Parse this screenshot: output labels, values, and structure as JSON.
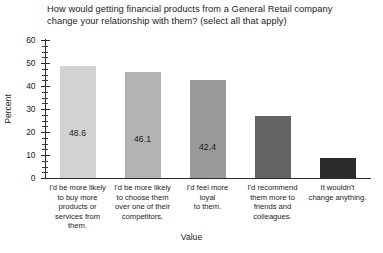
{
  "chart_data": {
    "type": "bar",
    "title": "How would getting financial products from a General Retail company\nchange your relationship with them? (select all that apply)",
    "xlabel": "Value",
    "ylabel": "Percent",
    "ylim": [
      0,
      60
    ],
    "y_major_ticks": [
      0,
      10,
      20,
      30,
      40,
      50,
      60
    ],
    "y_minor_tick_step": 2.5,
    "grid": false,
    "legend": "none",
    "categories": [
      "I'd be more likely\nto buy more\nproducts or\nservices from\nthem.",
      "I'd be more likely\nto choose them\nover one of their\ncompetitors.",
      "I'd feel more\nloyal\nto them.",
      "I'd recommend\nthem more to\nfriends and\ncolleagues.",
      "It wouldn't\nchange anything."
    ],
    "values": [
      48.6,
      46.1,
      42.4,
      26.8,
      8.6
    ],
    "value_labels": [
      "48.6",
      "46.1",
      "42.4",
      "26.8",
      "8.6"
    ],
    "bar_colors": [
      "#d2d2d2",
      "#b3b3b3",
      "#9a9a9a",
      "#636363",
      "#2b2b2b"
    ],
    "value_label_colors": [
      "#1b1b1b",
      "#1b1b1b",
      "#1b1b1b",
      "#ffffff",
      "#ffffff"
    ],
    "axis_color": "#2b2b2b",
    "background": "#ffffff"
  },
  "ticks": {
    "t60": "60",
    "t50": "50",
    "t40": "40",
    "t30": "30",
    "t20": "20",
    "t10": "10",
    "t0": "0"
  }
}
